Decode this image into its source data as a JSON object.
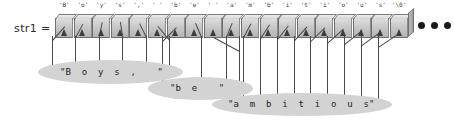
{
  "diagram": {
    "variable_label": "str1 =",
    "ellipsis": "•••",
    "colors": {
      "cell_face": "#c8c8c8",
      "cell_border": "#6e6e6e",
      "bubble": "#d3d3d3",
      "arrow": "#3c3c3c",
      "text": "#1f1f1f",
      "background": "#ffffff"
    },
    "array": {
      "cell_count": 19,
      "cells": [
        {
          "index": 0,
          "label": "'B'"
        },
        {
          "index": 1,
          "label": "'o'"
        },
        {
          "index": 2,
          "label": "'y'"
        },
        {
          "index": 3,
          "label": "'s'"
        },
        {
          "index": 4,
          "label": "','"
        },
        {
          "index": 5,
          "label": "' '"
        },
        {
          "index": 6,
          "label": "'b'"
        },
        {
          "index": 7,
          "label": "'e'"
        },
        {
          "index": 8,
          "label": "' '"
        },
        {
          "index": 9,
          "label": "'a'"
        },
        {
          "index": 10,
          "label": "'m'"
        },
        {
          "index": 11,
          "label": "'b'"
        },
        {
          "index": 12,
          "label": "'i'"
        },
        {
          "index": 13,
          "label": "'t'"
        },
        {
          "index": 14,
          "label": "'i'"
        },
        {
          "index": 15,
          "label": "'o'"
        },
        {
          "index": 16,
          "label": "'u'"
        },
        {
          "index": 17,
          "label": "'s'"
        },
        {
          "index": 18,
          "label": "'\\0'"
        }
      ]
    },
    "groups": [
      {
        "name": "boys-group",
        "text": "\"B  o  y  s  ,    \"",
        "literal": "\"Boys, \"",
        "first_cell": 0,
        "last_cell": 5
      },
      {
        "name": "be-group",
        "text": "\"b  e    \"",
        "literal": "\"be \"",
        "first_cell": 6,
        "last_cell": 8
      },
      {
        "name": "ambitious-group",
        "text": "\"a  m  b  i  t  i  o  u  s\"",
        "literal": "\"ambitious\"",
        "first_cell": 9,
        "last_cell": 18
      }
    ]
  }
}
